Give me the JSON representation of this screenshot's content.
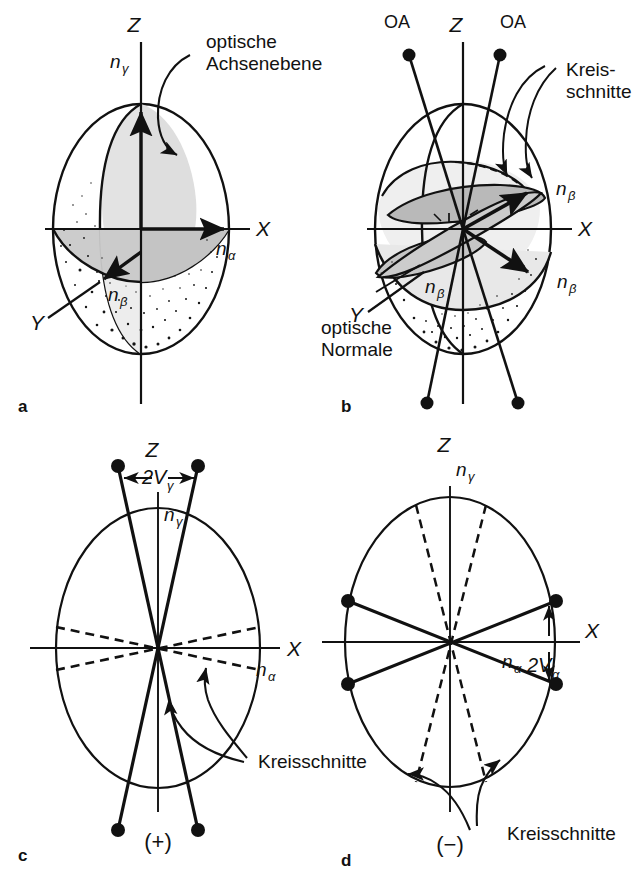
{
  "figure": {
    "panels": [
      {
        "letter": "a",
        "kind": "3d-indicatrix",
        "sign": "",
        "axes": [
          {
            "name": "Z",
            "label": "Z"
          },
          {
            "name": "X",
            "label": "X"
          },
          {
            "name": "Y",
            "label": "Y"
          }
        ],
        "indices": [
          {
            "name": "n-gamma",
            "base": "n",
            "sub": "γ"
          },
          {
            "name": "n-alpha",
            "base": "n",
            "sub": "α"
          },
          {
            "name": "n-beta",
            "base": "n",
            "sub": "β"
          }
        ],
        "callouts": [
          {
            "name": "optische-achsenebene",
            "line1": "optische",
            "line2": "Achsenebene"
          }
        ]
      },
      {
        "letter": "b",
        "kind": "3d-indicatrix",
        "sign": "",
        "axes": [
          {
            "name": "Z",
            "label": "Z"
          },
          {
            "name": "X",
            "label": "X"
          },
          {
            "name": "Y",
            "label": "Y"
          }
        ],
        "optic_axes": [
          {
            "name": "oa-left",
            "label": "OA"
          },
          {
            "name": "oa-right",
            "label": "OA"
          }
        ],
        "indices": [
          {
            "name": "n-beta-right-upper",
            "base": "n",
            "sub": "β"
          },
          {
            "name": "n-beta-right-lower",
            "base": "n",
            "sub": "β"
          },
          {
            "name": "n-beta-center",
            "base": "n",
            "sub": "β"
          }
        ],
        "callouts": [
          {
            "name": "kreisschnitte",
            "line1": "Kreis-",
            "line2": "schnitte"
          },
          {
            "name": "optische-normale",
            "line1": "optische",
            "line2": "Normale"
          }
        ]
      },
      {
        "letter": "c",
        "kind": "2d-section",
        "sign": "(+)",
        "axes": [
          {
            "name": "Z",
            "label": "Z"
          },
          {
            "name": "X",
            "label": "X"
          }
        ],
        "indices": [
          {
            "name": "n-gamma",
            "base": "n",
            "sub": "γ"
          },
          {
            "name": "n-alpha",
            "base": "n",
            "sub": "α"
          }
        ],
        "angle": {
          "name": "2V-gamma",
          "base": "2V",
          "sub": "γ",
          "about_axis": "Z"
        },
        "callouts": [
          {
            "name": "kreisschnitte",
            "line1": "Kreisschnitte",
            "line2": ""
          }
        ]
      },
      {
        "letter": "d",
        "kind": "2d-section",
        "sign": "(−)",
        "axes": [
          {
            "name": "Z",
            "label": "Z"
          },
          {
            "name": "X",
            "label": "X"
          }
        ],
        "indices": [
          {
            "name": "n-gamma",
            "base": "n",
            "sub": "γ"
          },
          {
            "name": "n-alpha",
            "base": "n",
            "sub": "α"
          }
        ],
        "angle": {
          "name": "2V-alpha",
          "base": "2V",
          "sub": "α",
          "about_axis": "X"
        },
        "callouts": [
          {
            "name": "kreisschnitte",
            "line1": "Kreisschnitte",
            "line2": ""
          }
        ]
      }
    ],
    "colors": {
      "ink": "#111111",
      "paper": "#ffffff",
      "shade_light": "#e6e6e6",
      "shade_mid": "#cccccc",
      "shade_dark": "#b3b3b3",
      "stipple": "#1a1a1a"
    }
  },
  "labels": {
    "panel_a_letter": "a",
    "panel_b_letter": "b",
    "panel_c_letter": "c",
    "panel_d_letter": "d",
    "axis_Z": "Z",
    "axis_X": "X",
    "axis_Y": "Y",
    "n_base": "n",
    "sub_gamma": "γ",
    "sub_alpha": "α",
    "sub_beta": "β",
    "oa": "OA",
    "optische": "optische",
    "achsenebene": "Achsenebene",
    "normale": "Normale",
    "kreis_hyphen": "Kreis-",
    "schnitte": "schnitte",
    "kreisschnitte": "Kreisschnitte",
    "twoV": "2V",
    "sign_plus": "(+)",
    "sign_minus": "(−)"
  }
}
